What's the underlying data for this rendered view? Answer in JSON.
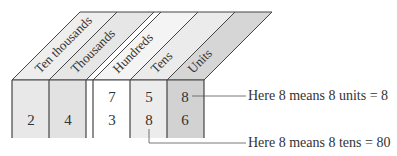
{
  "columns": [
    {
      "name": "Ten thousands",
      "top_digit": "",
      "bottom_digit": "2",
      "fill": "#e8e8e8"
    },
    {
      "name": "Thousands",
      "top_digit": "",
      "bottom_digit": "4",
      "fill": "#e2e2e2"
    },
    {
      "name": "Hundreds",
      "top_digit": "7",
      "bottom_digit": "3",
      "fill": "#ffffff"
    },
    {
      "name": "Tens",
      "top_digit": "5",
      "bottom_digit": "8",
      "fill": "#ececec"
    },
    {
      "name": "Units",
      "top_digit": "8",
      "bottom_digit": "6",
      "fill": "#d2d2d2"
    }
  ],
  "annotations": {
    "units_note": "Here 8 means 8 units = 8",
    "tens_note": "Here 8 means 8 tens = 80"
  }
}
